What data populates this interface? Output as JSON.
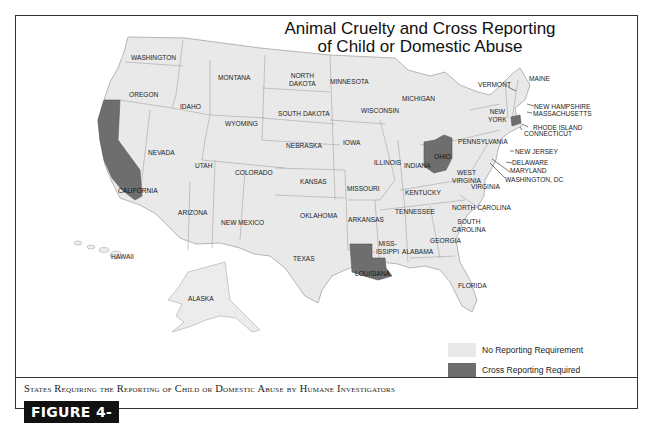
{
  "title_line1": "Animal Cruelty and Cross Reporting",
  "title_line2": "of Child or Domestic Abuse",
  "caption": "States Requiring the Reporting of Child or Domestic Abuse by Humane Investigators",
  "figure_label": "FIGURE 4-21",
  "colors": {
    "no_requirement": "#e9e9e9",
    "cross_reporting": "#6e6e6e",
    "border": "#9a9a9a"
  },
  "legend": [
    {
      "label": "No Reporting Requirement",
      "color": "#e9e9e9"
    },
    {
      "label": "Cross Reporting Required",
      "color": "#6e6e6e"
    }
  ],
  "cross_reporting_states": [
    "California",
    "Louisiana",
    "Ohio",
    "Connecticut"
  ],
  "labels": {
    "washington": "WASHINGTON",
    "oregon": "OREGON",
    "california": "CALIFORNIA",
    "nevada": "NEVADA",
    "idaho": "IDAHO",
    "montana": "MONTANA",
    "wyoming": "WYOMING",
    "utah": "UTAH",
    "arizona": "ARIZONA",
    "colorado": "COLORADO",
    "new_mexico": "NEW MEXICO",
    "north_dakota_1": "NORTH",
    "north_dakota_2": "DAKOTA",
    "south_dakota": "SOUTH DAKOTA",
    "nebraska": "NEBRASKA",
    "kansas": "KANSAS",
    "oklahoma": "OKLAHOMA",
    "texas": "TEXAS",
    "minnesota": "MINNESOTA",
    "iowa": "IOWA",
    "missouri": "MISSOURI",
    "arkansas": "ARKANSAS",
    "louisiana": "LOUISIANA",
    "wisconsin": "WISCONSIN",
    "illinois": "ILLINOIS",
    "michigan": "MICHIGAN",
    "indiana": "INDIANA",
    "ohio": "OHIO",
    "kentucky": "KENTUCKY",
    "tennessee": "TENNESSEE",
    "mississippi_1": "MISS-",
    "mississippi_2": "ISSIPPI",
    "alabama": "ALABAMA",
    "georgia": "GEORGIA",
    "florida": "FLORIDA",
    "south_carolina_1": "SOUTH",
    "south_carolina_2": "CAROLINA",
    "north_carolina": "NORTH CAROLINA",
    "virginia": "VIRGINIA",
    "west_virginia_1": "WEST",
    "west_virginia_2": "VIRGINIA",
    "pennsylvania": "PENNSYLVANIA",
    "new_york_1": "NEW",
    "new_york_2": "YORK",
    "vermont": "VERMONT",
    "maine": "MAINE",
    "new_hampshire": "NEW HAMPSHIRE",
    "massachusetts": "MASSACHUSETTS",
    "rhode_island": "RHODE ISLAND",
    "connecticut": "CONNECTICUT",
    "new_jersey": "NEW JERSEY",
    "delaware": "DELAWARE",
    "maryland": "MARYLAND",
    "washington_dc": "WASHINGTON, DC",
    "hawaii": "HAWAII",
    "alaska": "ALASKA"
  }
}
